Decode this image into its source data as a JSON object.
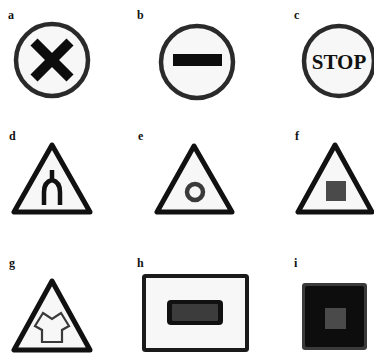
{
  "figure": {
    "panels": [
      {
        "label": "a",
        "shape": "circle",
        "symbol": "x-cross",
        "description": "Prohibition circle with bold black X"
      },
      {
        "label": "b",
        "shape": "circle",
        "symbol": "horizontal-bar",
        "description": "Circle with horizontal black bar (no entry)"
      },
      {
        "label": "c",
        "shape": "circle",
        "symbol": "text",
        "text": "STOP",
        "description": "Circle with STOP text"
      },
      {
        "label": "d",
        "shape": "triangle",
        "symbol": "forked-road",
        "description": "Warning triangle with forked road / Y junction"
      },
      {
        "label": "e",
        "shape": "triangle",
        "symbol": "ring",
        "description": "Warning triangle with gray ring"
      },
      {
        "label": "f",
        "shape": "triangle",
        "symbol": "square",
        "description": "Warning triangle with dark gray square"
      },
      {
        "label": "g",
        "shape": "triangle",
        "symbol": "shirt-outline",
        "description": "Warning triangle with shirt outline"
      },
      {
        "label": "h",
        "shape": "rectangle",
        "symbol": "rounded-bar",
        "description": "Rectangle with dark rounded bar"
      },
      {
        "label": "i",
        "shape": "square-filled",
        "symbol": "inner-square",
        "description": "Dark square with gray inner square"
      }
    ],
    "colors": {
      "stroke": "#1a1a1a",
      "fill_dark": "#0d0d0d",
      "fill_gray": "#4a4a4a",
      "ring_gray": "#3a3a3a",
      "background": "#ffffff",
      "panel_bg": "#f7f7f7"
    }
  }
}
